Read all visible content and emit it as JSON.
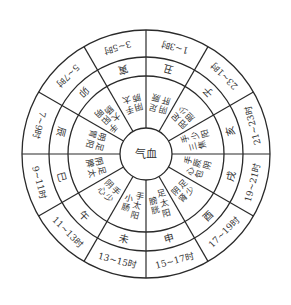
{
  "diagram": {
    "center_label": "气血",
    "geometry": {
      "cx": 146,
      "cy": 154,
      "r_outer": 124,
      "r_time": 97,
      "r_branch": 78,
      "r_center": 26
    },
    "colors": {
      "line": "#2a2a2a",
      "text": "#333333",
      "background": "#ffffff"
    },
    "sectors": [
      {
        "branch": "丑",
        "time": "1~3时",
        "meridian": "足厥阴肝"
      },
      {
        "branch": "子",
        "time": "23~1时",
        "meridian": "足少阳胆"
      },
      {
        "branch": "亥",
        "time": "21~23时",
        "meridian": "手少阳三焦"
      },
      {
        "branch": "戌",
        "time": "19~21时",
        "meridian": "手厥阴心包"
      },
      {
        "branch": "酉",
        "time": "17~19时",
        "meridian": "足少阴肾"
      },
      {
        "branch": "申",
        "time": "15~17时",
        "meridian": "足太阳膀胱"
      },
      {
        "branch": "未",
        "time": "13~15时",
        "meridian": "手太阳小肠"
      },
      {
        "branch": "午",
        "time": "11~13时",
        "meridian": "手少阴心"
      },
      {
        "branch": "巳",
        "time": "9~11时",
        "meridian": "足太阴脾"
      },
      {
        "branch": "辰",
        "time": "7~9时",
        "meridian": "足阳明胃"
      },
      {
        "branch": "卯",
        "time": "5~7时",
        "meridian": "手阳明大肠"
      },
      {
        "branch": "寅",
        "time": "3~5时",
        "meridian": "手太阴肺"
      }
    ]
  }
}
